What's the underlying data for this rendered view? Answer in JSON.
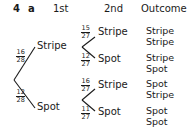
{
  "question": {
    "number": "4",
    "part": "a"
  },
  "headers": {
    "first": "1st",
    "second": "2nd",
    "outcome": "Outcome"
  },
  "first_branches": [
    {
      "label": "Stripe",
      "prob_num": "16",
      "prob_den": "28"
    },
    {
      "label": "Spot",
      "prob_num": "12",
      "prob_den": "28"
    }
  ],
  "second_branches": [
    {
      "label": "Stripe",
      "prob_num": "15",
      "prob_den": "27",
      "outcome": [
        "Stripe",
        "Stripe"
      ]
    },
    {
      "label": "Spot",
      "prob_num": "12",
      "prob_den": "27",
      "outcome": [
        "Stripe",
        "Spot"
      ]
    },
    {
      "label": "Stripe",
      "prob_num": "16",
      "prob_den": "27",
      "outcome": [
        "Spot",
        "Stripe"
      ]
    },
    {
      "label": "Spot",
      "prob_num": "11",
      "prob_den": "27",
      "outcome": [
        "Spot",
        "Spot"
      ]
    }
  ]
}
